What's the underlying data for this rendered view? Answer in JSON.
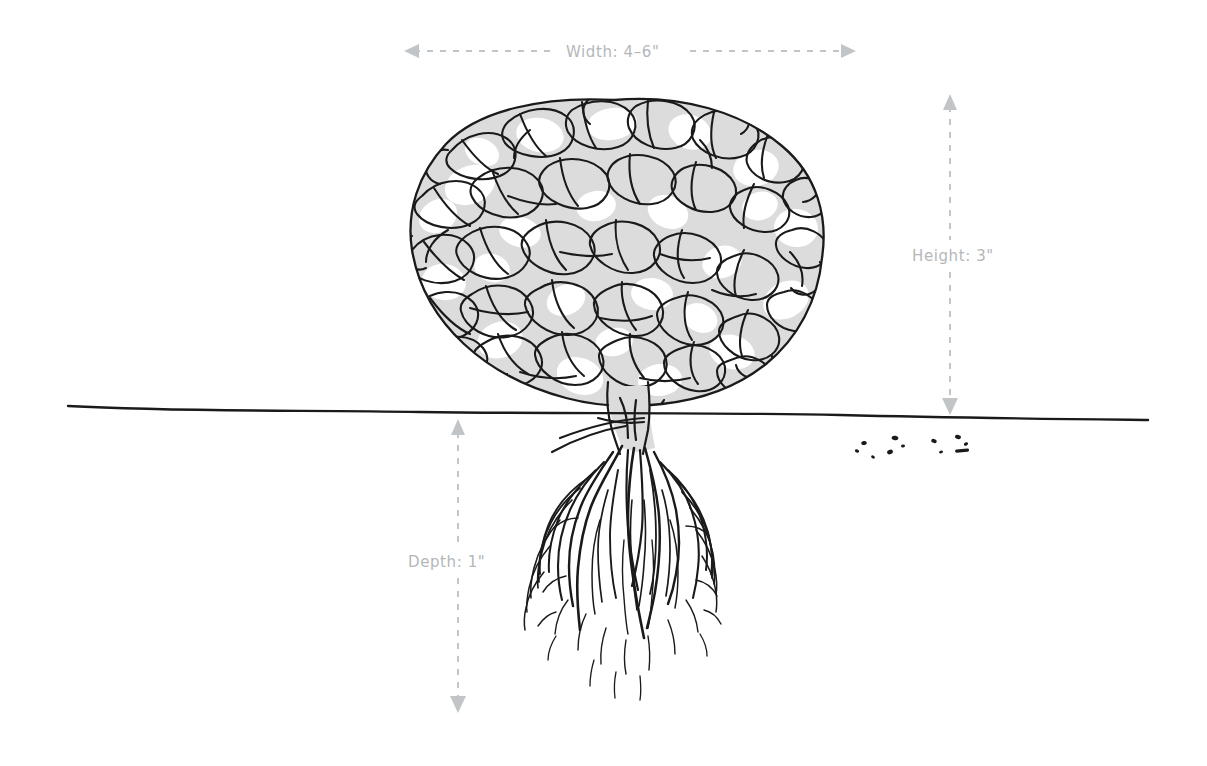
{
  "diagram": {
    "background_color": "#ffffff",
    "ink_color": "#1a1a1a",
    "fill_color": "#dcdcdc",
    "dimension_color": "#b4b7b9"
  },
  "dimensions": [
    {
      "id": "width",
      "label": "Width: 4–6\"",
      "orientation": "horizontal",
      "arrow_style": "double",
      "line_style": "dashed",
      "value": "4–6",
      "unit": "\"",
      "measures": "canopy-spread"
    },
    {
      "id": "height",
      "label": "Height: 3\"",
      "orientation": "vertical",
      "arrow_style": "double",
      "line_style": "dashed",
      "value": "3",
      "unit": "\"",
      "measures": "above-ground-height"
    },
    {
      "id": "depth",
      "label": "Depth: 1\"",
      "orientation": "vertical",
      "arrow_style": "double",
      "line_style": "dashed",
      "value": "1",
      "unit": "\"",
      "measures": "root-depth-below-soil"
    }
  ],
  "parts": {
    "canopy": "foliage-mass",
    "trunk": "stem",
    "ground_line": "soil-surface-line",
    "roots": "fibrous-root-system",
    "debris": "soil-specks"
  }
}
